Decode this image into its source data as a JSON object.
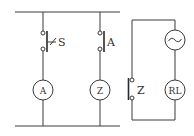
{
  "diagram": {
    "type": "electrical-circuit",
    "left_circuit": {
      "branches": [
        {
          "switch_label": "S",
          "switch_type": "push-button-normally-open",
          "device_label": "A"
        },
        {
          "switch_label": "A",
          "switch_type": "normally-open-contact",
          "device_label": "Z"
        }
      ]
    },
    "right_circuit": {
      "source_label": "~",
      "load_label": "RL",
      "contact_label": "Z",
      "contact_type": "normally-open-contact"
    }
  },
  "colors": {
    "line": "#3a3a3a",
    "background": "#ffffff",
    "text": "#333333"
  }
}
